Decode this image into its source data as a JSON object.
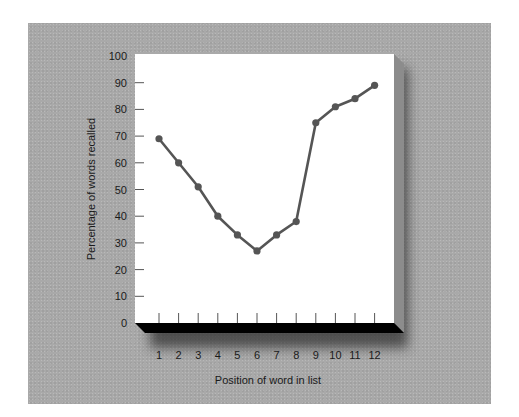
{
  "chart_data": {
    "type": "line",
    "title": "",
    "xlabel": "Position of word in list",
    "ylabel": "Percentage of words recalled",
    "categories": [
      "1",
      "2",
      "3",
      "4",
      "5",
      "6",
      "7",
      "8",
      "9",
      "10",
      "11",
      "12"
    ],
    "x": [
      1,
      2,
      3,
      4,
      5,
      6,
      7,
      8,
      9,
      10,
      11,
      12
    ],
    "values": [
      69,
      60,
      51,
      40,
      33,
      27,
      33,
      38,
      75,
      81,
      84,
      89
    ],
    "ylim": [
      0,
      100
    ],
    "yticks": [
      "0",
      "10",
      "20",
      "30",
      "40",
      "50",
      "60",
      "70",
      "80",
      "90",
      "100"
    ],
    "grid": false,
    "legend": null,
    "style": {
      "background": "#a9a9a9",
      "plot_background": "#ffffff",
      "line_color": "#555555",
      "marker_color": "#555555",
      "base_color": "#000000"
    }
  }
}
